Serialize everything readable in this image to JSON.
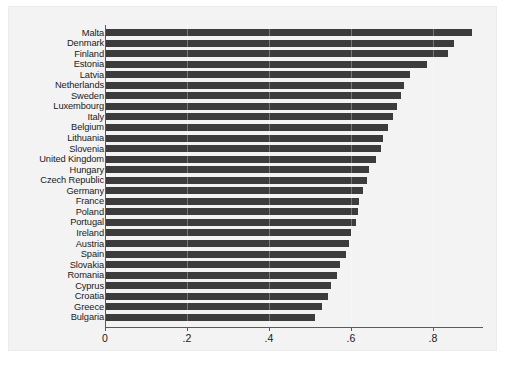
{
  "chart_data": {
    "type": "bar",
    "orientation": "horizontal",
    "title": "",
    "subtitle": "",
    "xlabel": "",
    "ylabel": "",
    "xlim": [
      0,
      0.95
    ],
    "ylim": null,
    "grid": false,
    "legend": null,
    "bar_color": "#3c3c3c",
    "panel_color": "#f3f3f3",
    "axis_color": "#5a5a5a",
    "xticks": [
      0,
      0.2,
      0.4,
      0.6,
      0.8
    ],
    "xticklabels": [
      "0",
      ".2",
      ".4",
      ".6",
      ".8"
    ],
    "categories": [
      "Malta",
      "Denmark",
      "Finland",
      "Estonia",
      "Latvia",
      "Netherlands",
      "Sweden",
      "Luxembourg",
      "Italy",
      "Belgium",
      "Lithuania",
      "Slovenia",
      "United Kingdom",
      "Hungary",
      "Czech Republic",
      "Germany",
      "France",
      "Poland",
      "Portugal",
      "Ireland",
      "Austria",
      "Spain",
      "Slovakia",
      "Romania",
      "Cyprus",
      "Croatia",
      "Greece",
      "Bulgaria"
    ],
    "values": [
      0.895,
      0.85,
      0.836,
      0.785,
      0.745,
      0.73,
      0.722,
      0.712,
      0.702,
      0.69,
      0.678,
      0.672,
      0.66,
      0.645,
      0.64,
      0.63,
      0.62,
      0.618,
      0.612,
      0.6,
      0.595,
      0.588,
      0.572,
      0.565,
      0.552,
      0.545,
      0.53,
      0.512
    ]
  }
}
